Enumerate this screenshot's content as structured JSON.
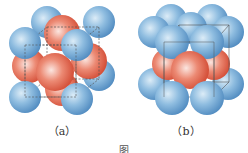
{
  "figure": {
    "panels": [
      {
        "id": "a",
        "label": "（a）",
        "description": "Face-centered cubic unit cell: blue corner atoms, red face-center atoms",
        "colors": {
          "corner_atom": "#7aaed6",
          "face_atom": "#e0604a",
          "cell_edge": "#555555"
        }
      },
      {
        "id": "b",
        "label": "（b）",
        "description": "Layered structure: blue atoms in top and bottom layers, red atoms in middle layer",
        "colors": {
          "layer_atom": "#7aaed6",
          "middle_atom": "#e0604a",
          "cell_edge": "#555555"
        }
      }
    ],
    "caption": "图"
  }
}
